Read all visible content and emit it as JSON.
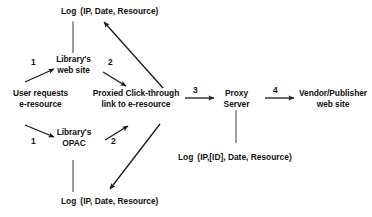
{
  "diagram": {
    "background_color": "#ffffff",
    "stroke_color": "#1a1a1a",
    "text_color": "#111111",
    "nodes": [
      {
        "id": "user_request",
        "name": "user-requests-node",
        "lines": [
          "User requests",
          "e-resource"
        ]
      },
      {
        "id": "library_web",
        "name": "librarys-web-site-node",
        "lines": [
          "Library's",
          "web site"
        ]
      },
      {
        "id": "library_opac",
        "name": "librarys-opac-node",
        "lines": [
          "Library's",
          "OPAC"
        ]
      },
      {
        "id": "proxied_link",
        "name": "proxied-click-through-node",
        "lines": [
          "Proxied Click-through",
          "link to e-resource"
        ]
      },
      {
        "id": "proxy_server",
        "name": "proxy-server-node",
        "lines": [
          "Proxy",
          "Server"
        ]
      },
      {
        "id": "vendor",
        "name": "vendor-publisher-node",
        "lines": [
          "Vendor/Publisher",
          "web site"
        ]
      }
    ],
    "logs": [
      {
        "id": "log_top",
        "name": "log-record-top",
        "label": "Log",
        "fields": "(IP, Date, Resource)"
      },
      {
        "id": "log_proxy",
        "name": "log-record-proxy",
        "label": "Log",
        "fields": "(IP,[ID], Date, Resource)"
      },
      {
        "id": "log_bottom",
        "name": "log-record-bottom",
        "label": "Log",
        "fields": "(IP, Date, Resource)"
      }
    ],
    "step_labels": [
      {
        "id": "s1a",
        "name": "step-label-1-web",
        "text": "1"
      },
      {
        "id": "s2a",
        "name": "step-label-2-web",
        "text": "2"
      },
      {
        "id": "s1b",
        "name": "step-label-1-opac",
        "text": "1"
      },
      {
        "id": "s2b",
        "name": "step-label-2-opac",
        "text": "2"
      },
      {
        "id": "s3",
        "name": "step-label-3-proxy",
        "text": "3"
      },
      {
        "id": "s4",
        "name": "step-label-4-vendor",
        "text": "4"
      }
    ]
  }
}
